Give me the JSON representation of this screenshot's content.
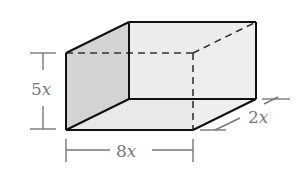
{
  "diagram": {
    "type": "rectangular-prism",
    "labels": {
      "height": {
        "coef": "5",
        "var": "x"
      },
      "length": {
        "coef": "8",
        "var": "x"
      },
      "depth": {
        "coef": "2",
        "var": "x"
      }
    },
    "colors": {
      "edge": "#1a1a1a",
      "dashed_edge": "#3a3a3a",
      "left_face": "#d6d6d6",
      "back_face": "#ececec",
      "bottom_face": "#e8e8e8",
      "dimension_line": "#7a7a7a",
      "label_text": "#7a7a7a"
    }
  }
}
